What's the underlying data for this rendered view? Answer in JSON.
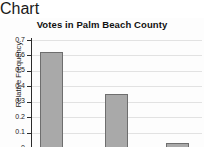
{
  "chart_data": {
    "type": "bar",
    "title": "Votes in Palm Beach County",
    "xlabel": "",
    "ylabel": "Relative Frequency",
    "categories": [
      "Gore",
      "Bush",
      "Nader"
    ],
    "values": [
      0.62,
      0.35,
      0.03
    ],
    "ylim": [
      0,
      0.7
    ],
    "ytick_labels": [
      "0",
      "0.1",
      "0.2",
      "0.3",
      "0.4",
      "0.5",
      "0.6",
      "0.7"
    ],
    "ytick_values": [
      0,
      0.1,
      0.2,
      0.3,
      0.4,
      0.5,
      0.6,
      0.7
    ],
    "grid": true,
    "legend": false,
    "colors": {
      "bar_fill": "#a9a9a9",
      "bar_border": "#6e6e6e",
      "axis": "#2b2b2b",
      "gridline": "#e2e2e2",
      "text": "#1a1a1a"
    }
  }
}
